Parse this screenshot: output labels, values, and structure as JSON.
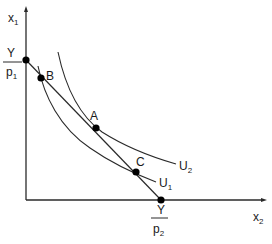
{
  "axes": {
    "y_label": "x",
    "y_label_sub": "1",
    "x_label": "x",
    "x_label_sub": "2"
  },
  "budget_line": {
    "y_intercept": {
      "numerator": "Y",
      "denominator": "p",
      "denominator_sub": "1"
    },
    "x_intercept": {
      "numerator": "Y",
      "denominator": "p",
      "denominator_sub": "2"
    }
  },
  "points": [
    {
      "label": "A"
    },
    {
      "label": "B"
    },
    {
      "label": "C"
    }
  ],
  "curves": [
    {
      "label": "U",
      "sub": "1"
    },
    {
      "label": "U",
      "sub": "2"
    }
  ],
  "colors": {
    "line": "#2a2a2a",
    "point": "#000000",
    "background": "#ffffff"
  }
}
